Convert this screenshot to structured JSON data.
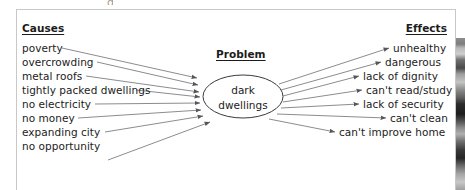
{
  "diagram": {
    "type": "cause-effect-fishbone",
    "title_clip": "g",
    "causes": {
      "heading": "Causes",
      "items": [
        "poverty",
        "overcrowding",
        "metal roofs",
        "tightly packed dwellings",
        "no electricity",
        "no money",
        "expanding city",
        "no opportunity"
      ]
    },
    "problem": {
      "heading": "Problem",
      "node_line1": "dark",
      "node_line2": "dwellings"
    },
    "effects": {
      "heading": "Effects",
      "items": [
        "unhealthy",
        "dangerous",
        "lack of dignity",
        "can't read/study",
        "lack of security",
        "can't clean",
        "can't improve home"
      ]
    },
    "colors": {
      "text": "#1c1c1c",
      "arrow": "#55555a",
      "panel_border": "#c8c8c8",
      "background": "#ffffff"
    }
  }
}
